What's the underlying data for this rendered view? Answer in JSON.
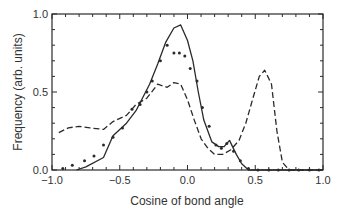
{
  "chart_data": {
    "type": "line",
    "title": "",
    "xlabel": "Cosine of bond angle",
    "ylabel": "Frequency (arb. units)",
    "xlim": [
      -1.0,
      1.0
    ],
    "ylim": [
      0.0,
      1.0
    ],
    "xticks": [
      -1.0,
      -0.5,
      0.0,
      0.5,
      1.0
    ],
    "xtick_labels": [
      "−1.0",
      "−0.5",
      "0.0",
      "0.5",
      "1.0"
    ],
    "yticks": [
      0.0,
      0.5,
      1.0
    ],
    "ytick_labels": [
      "0.0",
      "0.5",
      "1.0"
    ],
    "grid": false,
    "legend": null,
    "series": [
      {
        "name": "solid",
        "style": "solid",
        "x": [
          -0.82,
          -0.75,
          -0.62,
          -0.55,
          -0.45,
          -0.38,
          -0.28,
          -0.22,
          -0.16,
          -0.1,
          -0.05,
          0.0,
          0.04,
          0.08,
          0.12,
          0.18,
          0.23,
          0.27,
          0.31,
          0.36,
          0.4,
          0.45,
          0.6,
          0.8,
          1.0
        ],
        "y": [
          0.0,
          0.02,
          0.08,
          0.22,
          0.3,
          0.38,
          0.55,
          0.68,
          0.82,
          0.91,
          0.93,
          0.83,
          0.7,
          0.5,
          0.32,
          0.18,
          0.15,
          0.15,
          0.19,
          0.1,
          0.04,
          0.0,
          0.0,
          0.0,
          0.0
        ]
      },
      {
        "name": "dotted",
        "style": "dots",
        "x": [
          -0.92,
          -0.85,
          -0.76,
          -0.69,
          -0.62,
          -0.55,
          -0.48,
          -0.41,
          -0.35,
          -0.3,
          -0.26,
          -0.2,
          -0.15,
          -0.1,
          -0.06,
          -0.02,
          0.02,
          0.07,
          0.11,
          0.16,
          0.21,
          0.25,
          0.29,
          0.34,
          0.39,
          0.45,
          0.52,
          0.6,
          0.67,
          0.75,
          0.82,
          0.9,
          0.97
        ],
        "y": [
          0.01,
          0.03,
          0.06,
          0.09,
          0.16,
          0.21,
          0.27,
          0.39,
          0.42,
          0.5,
          0.57,
          0.7,
          0.8,
          0.75,
          0.75,
          0.73,
          0.65,
          0.57,
          0.4,
          0.28,
          0.16,
          0.14,
          0.17,
          0.12,
          0.06,
          0.01,
          0.0,
          0.0,
          0.0,
          0.0,
          0.0,
          0.0,
          0.0
        ]
      },
      {
        "name": "dashed",
        "style": "dashed",
        "x": [
          -0.95,
          -0.88,
          -0.8,
          -0.72,
          -0.62,
          -0.55,
          -0.45,
          -0.38,
          -0.3,
          -0.22,
          -0.15,
          -0.1,
          -0.05,
          0.0,
          0.05,
          0.1,
          0.15,
          0.2,
          0.26,
          0.32,
          0.38,
          0.43,
          0.48,
          0.53,
          0.57,
          0.62,
          0.66,
          0.7,
          0.75,
          0.85,
          1.0
        ],
        "y": [
          0.24,
          0.27,
          0.28,
          0.27,
          0.26,
          0.31,
          0.35,
          0.42,
          0.46,
          0.55,
          0.53,
          0.56,
          0.55,
          0.45,
          0.32,
          0.2,
          0.14,
          0.1,
          0.1,
          0.13,
          0.19,
          0.3,
          0.45,
          0.6,
          0.64,
          0.55,
          0.25,
          0.05,
          0.0,
          0.0,
          0.0
        ]
      }
    ]
  }
}
